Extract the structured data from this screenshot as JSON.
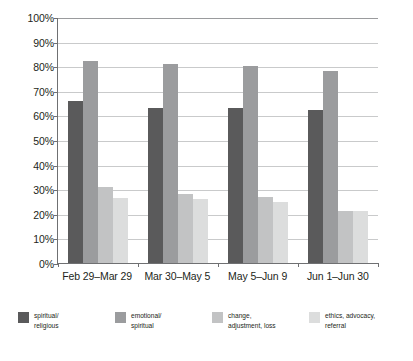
{
  "chart_data": {
    "type": "bar",
    "title": "",
    "subtitle": "",
    "xlabel": "",
    "ylabel": "",
    "ylim": [
      0,
      100
    ],
    "grid": true,
    "legend_position": "bottom",
    "categories": [
      "Feb 29–Mar 29",
      "Mar 30–May 5",
      "May 5–Jun 9",
      "Jun 1–Jun 30"
    ],
    "y_ticks": [
      "0%",
      "10%",
      "20%",
      "30%",
      "40%",
      "50%",
      "60%",
      "70%",
      "80%",
      "90%",
      "100%"
    ],
    "y_tick_values": [
      0,
      10,
      20,
      30,
      40,
      50,
      60,
      70,
      80,
      90,
      100
    ],
    "series": [
      {
        "name": "spiritual/\nreligious",
        "color": "#5a5a5b",
        "values": [
          66,
          63,
          63,
          62
        ]
      },
      {
        "name": "emotional/\nspiritual",
        "color": "#9b9c9e",
        "values": [
          82,
          81,
          80,
          78
        ]
      },
      {
        "name": "change,\nadjustment, loss",
        "color": "#c2c3c4",
        "values": [
          31,
          28,
          27,
          21
        ]
      },
      {
        "name": "ethics, advocacy,\nreferral",
        "color": "#dcdddd",
        "values": [
          26.5,
          26,
          25,
          21
        ]
      }
    ]
  }
}
